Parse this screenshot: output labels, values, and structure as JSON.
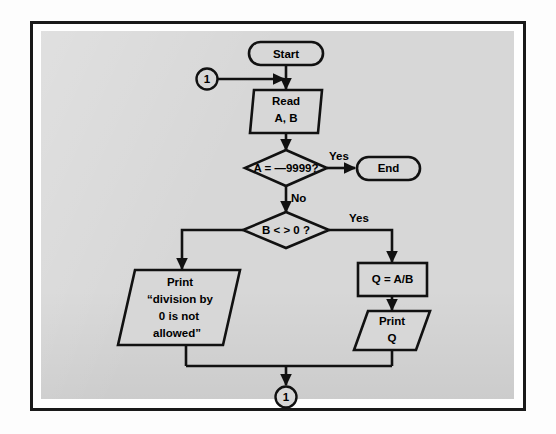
{
  "figure": {
    "kind": "flowchart",
    "background_color": "#d7d7d7",
    "frame_color": "#1a1a1a",
    "line_color": "#111111"
  },
  "nodes": {
    "start_terminal": {
      "label": "Start",
      "shape": "terminator"
    },
    "connector_in": {
      "label": "1",
      "shape": "connector"
    },
    "read_io": {
      "line1": "Read",
      "line2": "A, B",
      "shape": "parallelogram"
    },
    "decision_sentinel": {
      "label": "A = —9999?",
      "shape": "diamond"
    },
    "end_terminal": {
      "label": "End",
      "shape": "terminator"
    },
    "decision_zero": {
      "label": "B < > 0 ?",
      "shape": "diamond"
    },
    "process_divide": {
      "label": "Q = A/B",
      "shape": "rectangle"
    },
    "print_q_io": {
      "line1": "Print",
      "line2": "Q",
      "shape": "parallelogram"
    },
    "print_error_io": {
      "line1": "Print",
      "line2": "“division by",
      "line3": "0 is not",
      "line4": "allowed”",
      "shape": "parallelogram"
    },
    "connector_out": {
      "label": "1",
      "shape": "connector"
    }
  },
  "edge_labels": {
    "sentinel_yes": "Yes",
    "sentinel_no": "No",
    "zero_yes": "Yes"
  }
}
